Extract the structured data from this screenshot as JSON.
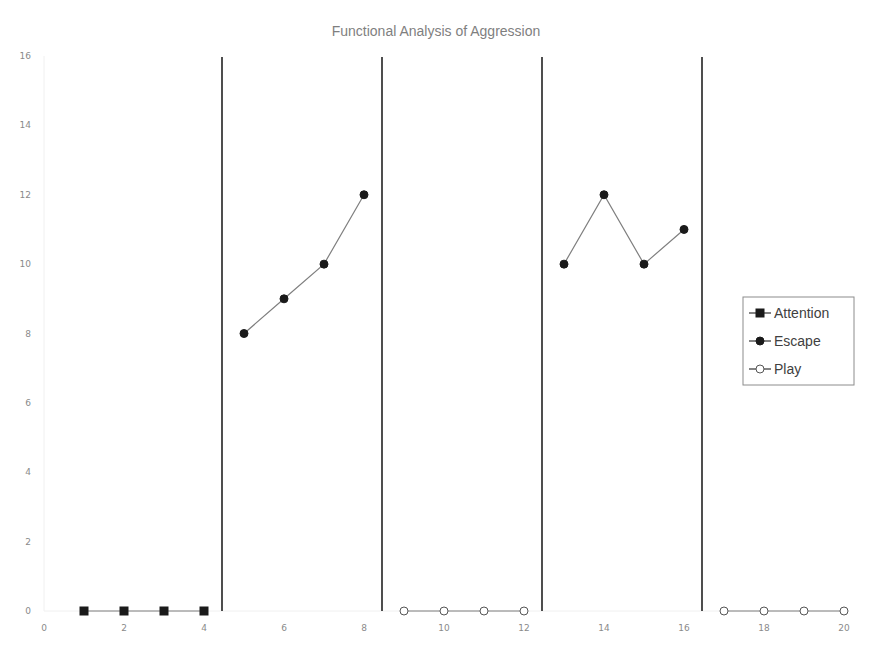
{
  "chart_data": {
    "type": "line",
    "title": "Functional Analysis of Aggression",
    "xlabel": "",
    "ylabel": "",
    "xlim": [
      0,
      20
    ],
    "ylim": [
      0,
      16
    ],
    "x_ticks": [
      0,
      2,
      4,
      6,
      8,
      10,
      12,
      14,
      16,
      18,
      20
    ],
    "y_ticks": [
      0,
      2,
      4,
      6,
      8,
      10,
      12,
      14,
      16
    ],
    "grid": false,
    "legend_position": "right",
    "phase_change_lines_x": [
      4.5,
      8.5,
      12.5,
      16.5
    ],
    "series": [
      {
        "name": "Attention",
        "marker": "filled-square",
        "segments": [
          {
            "x": [
              1,
              2,
              3,
              4
            ],
            "y": [
              0,
              0,
              0,
              0
            ]
          }
        ]
      },
      {
        "name": "Escape",
        "marker": "filled-circle",
        "segments": [
          {
            "x": [
              5,
              6,
              7,
              8
            ],
            "y": [
              8,
              9,
              10,
              12
            ]
          },
          {
            "x": [
              13,
              14,
              15,
              16
            ],
            "y": [
              10,
              12,
              10,
              11
            ]
          }
        ]
      },
      {
        "name": "Play",
        "marker": "open-circle",
        "segments": [
          {
            "x": [
              9,
              10,
              11,
              12
            ],
            "y": [
              0,
              0,
              0,
              0
            ]
          },
          {
            "x": [
              17,
              18,
              19,
              20
            ],
            "y": [
              0,
              0,
              0,
              0
            ]
          }
        ]
      }
    ]
  },
  "legend": {
    "items": [
      {
        "label": "Attention",
        "marker": "filled-square"
      },
      {
        "label": "Escape",
        "marker": "filled-circle"
      },
      {
        "label": "Play",
        "marker": "open-circle"
      }
    ]
  },
  "colors": {
    "line": "#7f7f7f",
    "marker": "#1a1a1a",
    "phase_line": "#222222",
    "text": "#8a8a8a"
  }
}
